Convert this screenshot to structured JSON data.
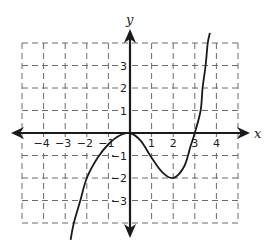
{
  "chart_data": {
    "type": "line",
    "title": "",
    "xlabel": "x",
    "ylabel": "y",
    "xlim": [
      -5,
      5
    ],
    "ylim": [
      -4,
      4
    ],
    "grid": true,
    "grid_style": "dashed",
    "x_ticks": [
      -4,
      -3,
      -2,
      -1,
      1,
      2,
      3,
      4
    ],
    "y_ticks": [
      3,
      2,
      1,
      -1,
      -2,
      -3
    ],
    "x_tick_labels": [
      "−4",
      "−3",
      "−2",
      "−1",
      "1",
      "2",
      "3",
      "4"
    ],
    "y_tick_labels": [
      "3",
      "2",
      "1",
      "−1",
      "−2",
      "−3"
    ],
    "series": [
      {
        "name": "f(x)",
        "color": "#1a1a1a",
        "x": [
          -2.75,
          -2.6,
          -2.3,
          -2.0,
          -1.5,
          -1.0,
          -0.5,
          0.0,
          0.5,
          1.0,
          1.5,
          2.0,
          2.5,
          2.8,
          3.0,
          3.27,
          3.36,
          3.5,
          3.6,
          3.7
        ],
        "y": [
          -4.75,
          -4.0,
          -3.0,
          -2.0,
          -1.1,
          -0.5,
          -0.12,
          0.0,
          -0.35,
          -1.1,
          -1.75,
          -2.0,
          -1.5,
          -0.6,
          0.0,
          1.0,
          2.0,
          3.0,
          4.0,
          4.45
        ]
      }
    ],
    "annotations": [
      {
        "text": "local maximum at (0, 0)"
      },
      {
        "text": "local minimum at (2, -2)"
      },
      {
        "text": "x-intercepts at 0 and 3"
      }
    ]
  },
  "labels": {
    "x_axis": "x",
    "y_axis": "y"
  }
}
